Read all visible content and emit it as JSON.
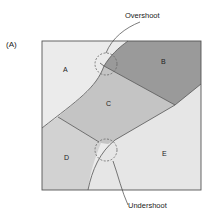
{
  "figure": {
    "panel_label": "(A)",
    "callouts": {
      "top": "Overshoot",
      "bottom": "Undershoot"
    },
    "regions": [
      {
        "id": "A",
        "label": "A",
        "color": "#ebebeb"
      },
      {
        "id": "B",
        "label": "B",
        "color": "#9a9a9a"
      },
      {
        "id": "C",
        "label": "C",
        "color": "#c4c4c4"
      },
      {
        "id": "D",
        "label": "D",
        "color": "#d2d2d2"
      },
      {
        "id": "E",
        "label": "E",
        "color": "#e6e6e6"
      }
    ],
    "border_color": "#555555"
  }
}
